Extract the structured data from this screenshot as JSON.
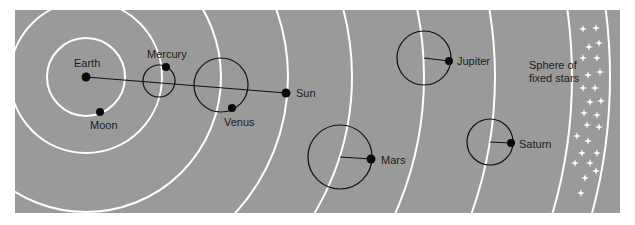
{
  "diagram": {
    "background_color": "#9a9a9a",
    "ring_color": "#ffffff",
    "line_color": "#111111",
    "panel": {
      "x": 15,
      "y": 10,
      "width": 605,
      "height": 203
    },
    "center": {
      "name": "Earth",
      "x": 86,
      "y": 77
    },
    "labels": {
      "earth": "Earth",
      "moon": "Moon",
      "mercury": "Mercury",
      "venus": "Venus",
      "sun": "Sun",
      "mars": "Mars",
      "jupiter": "Jupiter",
      "saturn": "Saturn",
      "stars_line1": "Sphere of",
      "stars_line2": "fixed stars"
    },
    "orbits": [
      {
        "body": "Moon",
        "radius": 39
      },
      {
        "body": "Mercury",
        "radius": 76
      },
      {
        "body": "Venus",
        "radius": 135
      },
      {
        "body": "Sun",
        "radius": 202
      },
      {
        "body": "Mars",
        "radius": 266
      },
      {
        "body": "Jupiter",
        "radius": 338
      },
      {
        "body": "Saturn",
        "radius": 409
      },
      {
        "body": "Fixed stars inner",
        "radius": 486
      },
      {
        "body": "Fixed stars outer",
        "radius": 524
      }
    ],
    "bodies": [
      {
        "name": "Moon",
        "x": 100,
        "y": 112,
        "epicycle": null
      },
      {
        "name": "Mercury",
        "x": 166,
        "y": 67,
        "epicycle": {
          "cx": 159,
          "cy": 81,
          "r": 16
        }
      },
      {
        "name": "Venus",
        "x": 232,
        "y": 108,
        "epicycle": {
          "cx": 221,
          "cy": 85,
          "r": 27
        }
      },
      {
        "name": "Sun",
        "x": 286,
        "y": 93,
        "epicycle": null
      },
      {
        "name": "Mars",
        "x": 371,
        "y": 159,
        "epicycle": {
          "cx": 340,
          "cy": 157,
          "r": 32
        }
      },
      {
        "name": "Jupiter",
        "x": 449,
        "y": 61,
        "epicycle": {
          "cx": 424,
          "cy": 58,
          "r": 27
        }
      },
      {
        "name": "Saturn",
        "x": 511,
        "y": 143,
        "epicycle": {
          "cx": 490,
          "cy": 142,
          "r": 23
        }
      }
    ],
    "earth_sun_line": {
      "x1": 86,
      "y1": 77,
      "x2": 286,
      "y2": 93
    },
    "stars": [
      [
        583,
        29
      ],
      [
        596,
        28
      ],
      [
        589,
        47
      ],
      [
        599,
        43
      ],
      [
        583,
        58
      ],
      [
        597,
        58
      ],
      [
        588,
        75
      ],
      [
        600,
        72
      ],
      [
        583,
        88
      ],
      [
        595,
        88
      ],
      [
        590,
        102
      ],
      [
        601,
        101
      ],
      [
        584,
        113
      ],
      [
        597,
        115
      ],
      [
        587,
        125
      ],
      [
        599,
        127
      ],
      [
        577,
        136
      ],
      [
        588,
        141
      ],
      [
        582,
        153
      ],
      [
        597,
        153
      ],
      [
        575,
        163
      ],
      [
        590,
        163
      ],
      [
        596,
        171
      ],
      [
        585,
        178
      ],
      [
        581,
        193
      ]
    ]
  }
}
